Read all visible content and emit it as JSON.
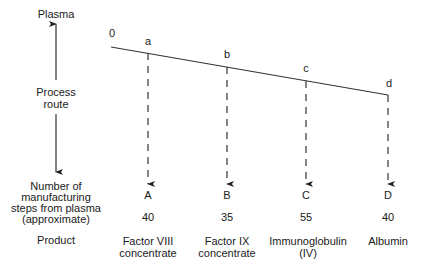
{
  "left_axis": {
    "top_label": "Plasma",
    "middle_label_line1": "Process",
    "middle_label_line2": "route",
    "steps_label_lines": [
      "Number of",
      "manufacturing",
      "steps from plasma",
      "(approximate)"
    ],
    "product_label": "Product"
  },
  "route": {
    "origin_label": "0",
    "branch_points": [
      "a",
      "b",
      "c",
      "d"
    ]
  },
  "products": [
    {
      "end_label": "A",
      "steps": "40",
      "name_line1": "Factor VIII",
      "name_line2": "concentrate"
    },
    {
      "end_label": "B",
      "steps": "35",
      "name_line1": "Factor IX",
      "name_line2": "concentrate"
    },
    {
      "end_label": "C",
      "steps": "55",
      "name_line1": "Immunoglobulin",
      "name_line2": "(IV)"
    },
    {
      "end_label": "D",
      "steps": "40",
      "name_line1": "Albumin",
      "name_line2": ""
    }
  ],
  "colors": {
    "line": "#333333",
    "text": "#1a1a1a",
    "background": "#ffffff"
  }
}
